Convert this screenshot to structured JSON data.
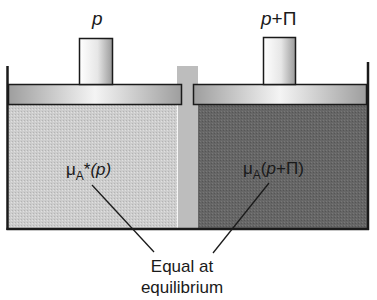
{
  "figure": {
    "type": "osmosis-apparatus",
    "colors": {
      "solvent": "#c8c8c8",
      "solution": "#6a6a6a",
      "membrane": "#bcbcbc",
      "piston": "#a9a9a9",
      "piston_highlight": "#f2f2f2",
      "outline": "#1a1a1a"
    },
    "left": {
      "pressure_label": "p",
      "potential_symbol": "μ",
      "potential_subscript": "A",
      "potential_superscript": "*",
      "potential_argument": "(p)"
    },
    "right": {
      "pressure_label_var": "p",
      "pressure_label_op": "+",
      "pressure_label_osm": "Π",
      "potential_symbol": "μ",
      "potential_subscript": "A",
      "potential_argument_open": "(",
      "potential_argument_var": "p",
      "potential_argument_rest": "+Π)"
    },
    "caption": {
      "line1": "Equal at",
      "line2": "equilibrium"
    }
  }
}
